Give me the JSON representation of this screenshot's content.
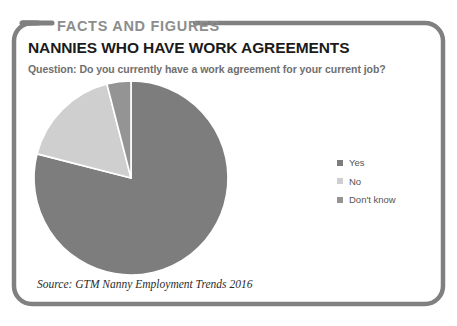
{
  "banner": {
    "label": "FACTS AND FIGURES"
  },
  "header": {
    "title": "NANNIES WHO HAVE WORK AGREEMENTS",
    "question": "Question: Do you currently have a work agreement for your current job?"
  },
  "footer": {
    "source": "Source: GTM Nanny Employment Trends 2016"
  },
  "legend": {
    "position": "right",
    "items": [
      {
        "label": "Yes",
        "color": "#7d7d7d"
      },
      {
        "label": "No",
        "color": "#cfcfcf"
      },
      {
        "label": "Don't know",
        "color": "#949494"
      }
    ]
  },
  "colors": {
    "frame": "#808080",
    "banner_text": "#8d8d8d",
    "title_text": "#1b1b1b",
    "question_text": "#6f6f6f",
    "source_text": "#2b2b2b",
    "slice_separator": "#ffffff"
  },
  "chart_data": {
    "type": "pie",
    "title": "NANNIES WHO HAVE WORK AGREEMENTS",
    "subtitle": "Question: Do you currently have a work agreement for your current job?",
    "labels": [
      "Yes",
      "No",
      "Don't know"
    ],
    "values": [
      79,
      17,
      4
    ],
    "unit": "percent",
    "colors": [
      "#7d7d7d",
      "#cfcfcf",
      "#949494"
    ],
    "start_angle_deg": 0,
    "direction": "clockwise",
    "legend": "right",
    "data_labels_shown": false,
    "grid": false,
    "source": "Source: GTM Nanny Employment Trends 2016"
  }
}
